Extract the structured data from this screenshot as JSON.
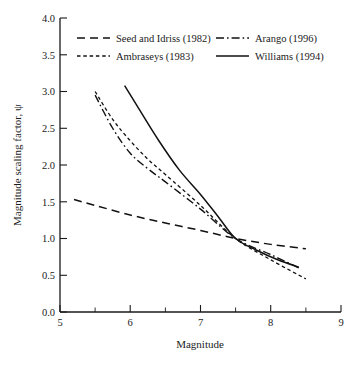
{
  "chart_data": {
    "type": "line",
    "title": "",
    "xlabel": "Magnitude",
    "ylabel": "Magnitude scaling factor, ψ",
    "xlim": [
      5,
      9
    ],
    "ylim": [
      0.0,
      4.0
    ],
    "xticks": [
      "5",
      "6",
      "7",
      "8",
      "9"
    ],
    "xtick_values": [
      5,
      6,
      7,
      8,
      9
    ],
    "xminor_values": [
      5.5,
      6.5,
      7.5,
      8.5
    ],
    "yticks": [
      "0.0",
      "0.5",
      "1.0",
      "1.5",
      "2.0",
      "2.5",
      "3.0",
      "3.5",
      "4.0"
    ],
    "ytick_values": [
      0.0,
      0.5,
      1.0,
      1.5,
      2.0,
      2.5,
      3.0,
      3.5,
      4.0
    ],
    "grid": false,
    "legend_position": "top",
    "series": [
      {
        "name": "Seed and Idriss (1982)",
        "style": "long-dash",
        "x": [
          5.2,
          5.5,
          6.0,
          6.5,
          7.0,
          7.5,
          8.0,
          8.5
        ],
        "values": [
          1.53,
          1.45,
          1.32,
          1.21,
          1.11,
          1.0,
          0.92,
          0.86
        ]
      },
      {
        "name": "Ambraseys (1983)",
        "style": "short-dash",
        "x": [
          5.5,
          5.75,
          6.0,
          6.25,
          6.5,
          7.0,
          7.5,
          8.0,
          8.5
        ],
        "values": [
          3.0,
          2.62,
          2.33,
          2.08,
          1.87,
          1.45,
          1.0,
          0.71,
          0.45
        ]
      },
      {
        "name": "Arango (1996)",
        "style": "dash-dot",
        "x": [
          5.5,
          5.75,
          6.0,
          6.25,
          6.5,
          7.0,
          7.5,
          8.0,
          8.4
        ],
        "values": [
          2.95,
          2.5,
          2.16,
          1.95,
          1.77,
          1.4,
          1.0,
          0.78,
          0.6
        ]
      },
      {
        "name": "Williams (1994)",
        "style": "solid",
        "x": [
          5.92,
          6.1,
          6.4,
          6.7,
          7.0,
          7.25,
          7.5,
          7.8,
          8.1,
          8.4
        ],
        "values": [
          3.08,
          2.8,
          2.34,
          1.93,
          1.6,
          1.3,
          1.0,
          0.84,
          0.71,
          0.61
        ]
      }
    ]
  },
  "legend": {
    "entries": [
      {
        "label": "Seed and Idriss (1982)",
        "style": "long-dash"
      },
      {
        "label": "Arango (1996)",
        "style": "dash-dot"
      },
      {
        "label": "Ambraseys (1983)",
        "style": "short-dash"
      },
      {
        "label": "Williams (1994)",
        "style": "solid"
      }
    ]
  },
  "colors": {
    "line": "#111111",
    "axis": "#1a1a1a",
    "background": "#ffffff"
  }
}
